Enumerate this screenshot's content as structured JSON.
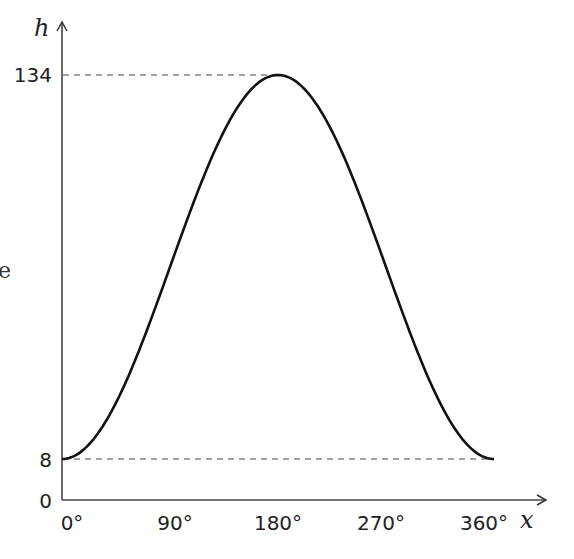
{
  "chart_data": {
    "type": "line",
    "title": "",
    "xlabel": "x",
    "ylabel": "h",
    "x_ticks": [
      "0°",
      "90°",
      "180°",
      "270°",
      "360°"
    ],
    "y_ticks": [
      "0",
      "8",
      "134"
    ],
    "xlim": [
      0,
      360
    ],
    "ylim": [
      0,
      134
    ],
    "grid": false,
    "reference_lines": [
      {
        "orientation": "horizontal",
        "value": 134,
        "style": "dashed",
        "extent": "to peak"
      },
      {
        "orientation": "horizontal",
        "value": 8,
        "style": "dashed",
        "extent": "to 360°"
      }
    ],
    "series": [
      {
        "name": "h",
        "x": [
          0,
          45,
          90,
          135,
          180,
          225,
          270,
          315,
          360
        ],
        "values": [
          8,
          26.5,
          71,
          115.5,
          134,
          115.5,
          71,
          26.5,
          8
        ]
      }
    ]
  },
  "labels": {
    "y_axis_var": "h",
    "x_axis_var": "x",
    "y_tick_134": "134",
    "y_tick_8": "8",
    "y_tick_0": "0",
    "x_tick_0": "0°",
    "x_tick_90": "90°",
    "x_tick_180": "180°",
    "x_tick_270": "270°",
    "x_tick_360": "360°",
    "stray_char": "e"
  }
}
